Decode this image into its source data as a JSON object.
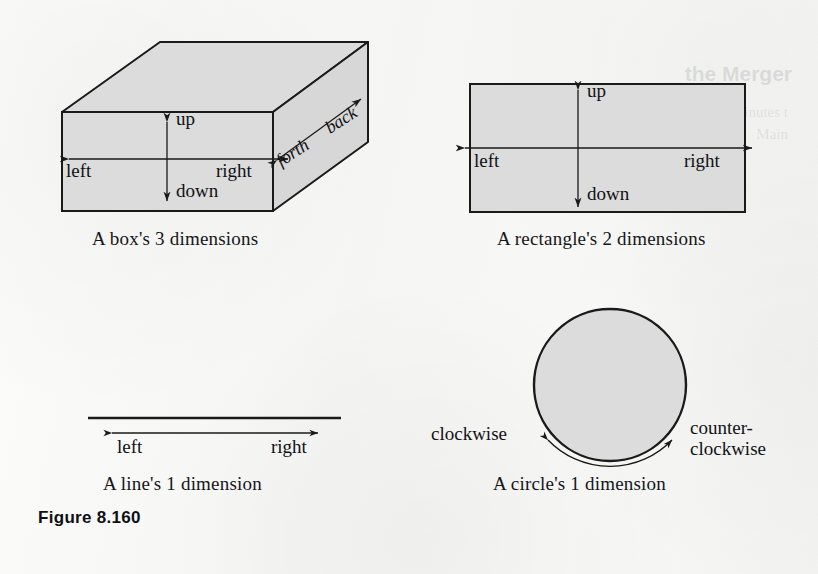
{
  "figure": {
    "number_label": "Figure 8.160",
    "background_color": "#f5f5f4",
    "shape_fill_color": "#dcdcdc",
    "ink_color": "#1a1a1a"
  },
  "panels": [
    {
      "id": "box",
      "shape": "rectangular-box-3d",
      "caption": "A box's 3 dimensions",
      "dimension_count": 3,
      "labels": {
        "up": "up",
        "down": "down",
        "left": "left",
        "right": "right",
        "forth": "forth",
        "back": "back"
      },
      "axes": [
        {
          "name": "vertical",
          "arrow": "double",
          "ends": [
            "up",
            "down"
          ]
        },
        {
          "name": "horizontal",
          "arrow": "double",
          "ends": [
            "left",
            "right"
          ]
        },
        {
          "name": "depth",
          "arrow": "double",
          "ends": [
            "forth",
            "back"
          ]
        }
      ]
    },
    {
      "id": "rectangle",
      "shape": "rectangle-2d",
      "caption": "A rectangle's 2 dimensions",
      "dimension_count": 2,
      "labels": {
        "up": "up",
        "down": "down",
        "left": "left",
        "right": "right"
      },
      "axes": [
        {
          "name": "vertical",
          "arrow": "double",
          "ends": [
            "up",
            "down"
          ]
        },
        {
          "name": "horizontal",
          "arrow": "double",
          "ends": [
            "left",
            "right"
          ]
        }
      ]
    },
    {
      "id": "line",
      "shape": "line-1d",
      "caption": "A line's 1 dimension",
      "dimension_count": 1,
      "labels": {
        "left": "left",
        "right": "right"
      },
      "axes": [
        {
          "name": "horizontal",
          "arrow": "double",
          "ends": [
            "left",
            "right"
          ]
        }
      ]
    },
    {
      "id": "circle",
      "shape": "circle-1d",
      "caption": "A circle's 1 dimension",
      "dimension_count": 1,
      "labels": {
        "clockwise": "clockwise",
        "counterclockwise_line1": "counter-",
        "counterclockwise_line2": "clockwise"
      },
      "axes": [
        {
          "name": "rotational",
          "arrow": "double",
          "ends": [
            "clockwise",
            "counter-clockwise"
          ]
        }
      ]
    }
  ],
  "ghost_text": {
    "heading": "the Merger",
    "line_1": "minutes t",
    "line_2": "Main",
    "left_1": "",
    "left_2": ""
  }
}
